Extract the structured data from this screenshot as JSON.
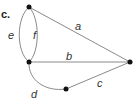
{
  "figure": {
    "panel_label": "c.",
    "nodes": [
      {
        "id": "top",
        "x": 29,
        "y": 7
      },
      {
        "id": "left",
        "x": 29,
        "y": 62
      },
      {
        "id": "right",
        "x": 130,
        "y": 62
      },
      {
        "id": "bottom",
        "x": 66,
        "y": 89
      }
    ],
    "edges": [
      {
        "label": "a",
        "from": "top",
        "to": "right"
      },
      {
        "label": "b",
        "from": "left",
        "to": "right"
      },
      {
        "label": "c",
        "from": "bottom",
        "to": "right"
      },
      {
        "label": "d",
        "from": "left",
        "to": "bottom"
      },
      {
        "label": "e",
        "from": "top",
        "to": "left"
      },
      {
        "label": "f",
        "from": "top",
        "to": "left"
      }
    ],
    "colors": {
      "edge": "#8a8a8a",
      "node": "#111111"
    }
  }
}
